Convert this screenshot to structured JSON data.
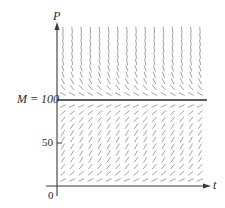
{
  "figure": {
    "type": "slope_field",
    "equation": "dP/dt = kP(1 - P/M)",
    "y_axis_label": "P",
    "x_axis_label": "t",
    "equilibrium_label": "M = 100",
    "tick_50_label": "50",
    "origin_label": "0",
    "colors": {
      "axis": "#3a3a3a",
      "segment": "#8a8a8a",
      "equilibrium_line": "#2a2a2a",
      "text": "#2a2a2a"
    }
  },
  "chart_data": {
    "type": "slope_field",
    "title": "",
    "xlabel": "t",
    "ylabel": "P",
    "equation": "dP/dt = kP(1 - P/M)",
    "parameters": {
      "M": 100
    },
    "y_ticks": [
      {
        "value": 0,
        "label": "0"
      },
      {
        "value": 50,
        "label": "50"
      },
      {
        "value": 100,
        "label": "M = 100"
      }
    ],
    "ylim": [
      0,
      200
    ],
    "equilibrium_solutions": [
      0,
      100
    ],
    "grid": {
      "columns": 16,
      "rows_below_M": 12,
      "rows_above_M": 11
    },
    "annotations": [
      "M = 100 horizontal equilibrium line"
    ],
    "legend": null
  }
}
